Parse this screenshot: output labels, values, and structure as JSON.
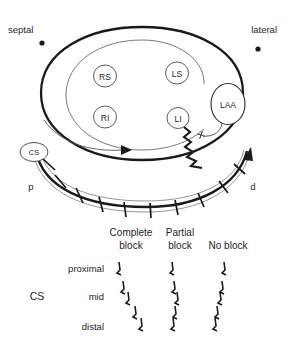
{
  "figure": {
    "anatomy": {
      "orientation_labels": [
        {
          "name": "septal",
          "text": "septal",
          "x": 8,
          "y": 30,
          "dot_x": 42,
          "dot_y": 42
        },
        {
          "name": "lateral",
          "text": "lateral",
          "x": 245,
          "y": 30,
          "dot_x": 258,
          "dot_y": 48
        }
      ],
      "chamber_name": "left-atrium",
      "pulmonary_veins": [
        {
          "id": "RS",
          "label": "RS",
          "cx": 105,
          "cy": 76,
          "rx": 11,
          "ry": 11
        },
        {
          "id": "LS",
          "label": "LS",
          "cx": 177,
          "cy": 73,
          "rx": 11,
          "ry": 11
        },
        {
          "id": "RI",
          "label": "RI",
          "cx": 105,
          "cy": 117,
          "rx": 11,
          "ry": 11
        },
        {
          "id": "LI",
          "label": "LI",
          "cx": 178,
          "cy": 118,
          "rx": 10.5,
          "ry": 10.5
        }
      ],
      "appendage": {
        "id": "LAA",
        "label": "LAA",
        "cx": 228,
        "cy": 104,
        "rx": 17,
        "ry": 20
      },
      "catheter": {
        "label": "CS",
        "proximal_label": "p",
        "distal_label": "d",
        "electrode_count": 10
      },
      "block_marker": "cross-mark",
      "activation_arrow": "counterclockwise-arrow",
      "conduction_zigzag": "slow-conduction-zigzag"
    },
    "recordings": {
      "row_group_label": "CS",
      "columns": [
        {
          "id": "complete",
          "label_line1": "Complete",
          "label_line2": "block",
          "x": 132,
          "shifts": [
            0,
            4,
            9,
            16,
            22
          ]
        },
        {
          "id": "partial",
          "label_line1": "Partial",
          "label_line2": "block",
          "x": 177,
          "shifts": [
            0,
            2,
            5,
            3,
            1
          ]
        },
        {
          "id": "none",
          "label_line1": "No block",
          "label_line2": "",
          "x": 220,
          "shifts": [
            0,
            -1,
            -3,
            -5,
            -7
          ]
        }
      ],
      "rows": [
        {
          "id": "proximal",
          "label": "proximal",
          "y": 269
        },
        {
          "id": "mid_upper",
          "label": "",
          "y": 284
        },
        {
          "id": "mid",
          "label": "mid",
          "y": 297
        },
        {
          "id": "mid_lower",
          "label": "",
          "y": 312
        },
        {
          "id": "distal",
          "label": "distal",
          "y": 327
        }
      ]
    },
    "colors": {
      "ink": "#1a1a1a",
      "line": "#242424",
      "thin_line": "#55555a",
      "background": "#ffffff"
    }
  }
}
